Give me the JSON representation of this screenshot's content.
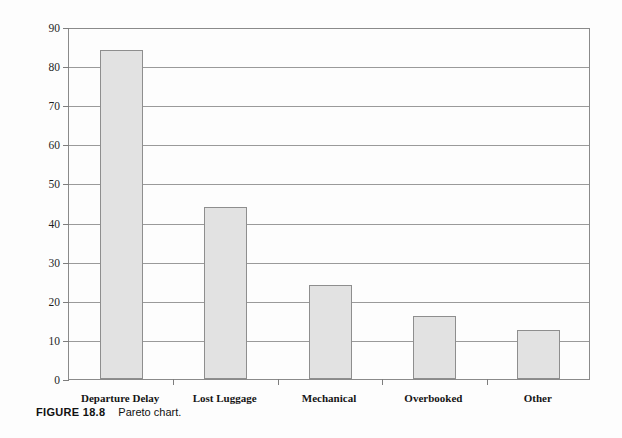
{
  "figure": {
    "tag": "FIGURE 18.8",
    "caption": "Pareto chart."
  },
  "chart_data": {
    "type": "bar",
    "title": "",
    "xlabel": "",
    "ylabel": "Number of Problems",
    "categories": [
      "Departure Delay",
      "Lost Luggage",
      "Mechanical",
      "Overbooked",
      "Other"
    ],
    "values": [
      84,
      44,
      24,
      16,
      12.5
    ],
    "ylim": [
      0,
      90
    ],
    "ytick_values": [
      0,
      10,
      20,
      30,
      40,
      50,
      60,
      70,
      80,
      90
    ],
    "ytick_labels": [
      "0",
      "10",
      "20",
      "30",
      "40",
      "50",
      "60",
      "70",
      "80",
      "90"
    ],
    "grid": "horizontal",
    "legend": "none",
    "bar_fill_color": "#e2e2e2",
    "bar_border_color": "#8e8e8e",
    "gridline_color": "#9a9a9a",
    "axis_color": "#8a8a8a",
    "background_color": "#fdfdfd"
  }
}
